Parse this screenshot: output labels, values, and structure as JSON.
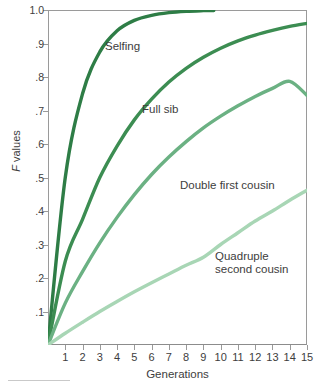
{
  "chart_data": {
    "type": "line",
    "title": "",
    "xlabel": "Generations",
    "ylabel": "F values",
    "ylabel_italic_prefix": "F",
    "ylabel_rest": " values",
    "xlim": [
      0,
      15
    ],
    "ylim": [
      0,
      1.0
    ],
    "grid": false,
    "legend_position": "inline-annotations",
    "x": [
      0,
      1,
      2,
      3,
      4,
      5,
      6,
      7,
      8,
      9,
      10,
      11,
      12,
      13,
      14,
      15
    ],
    "x_tick_labels": [
      "1",
      "2",
      "3",
      "4",
      "5",
      "6",
      "7",
      "8",
      "9",
      "10",
      "11",
      "12",
      "13",
      "14",
      "15"
    ],
    "x_tick_values": [
      1,
      2,
      3,
      4,
      5,
      6,
      7,
      8,
      9,
      10,
      11,
      12,
      13,
      14,
      15
    ],
    "y_tick_labels": [
      "1.0",
      ".9",
      ".8",
      ".7",
      ".6",
      ".5",
      ".4",
      ".3",
      ".2",
      ".1"
    ],
    "y_tick_values": [
      1.0,
      0.9,
      0.8,
      0.7,
      0.6,
      0.5,
      0.4,
      0.3,
      0.2,
      0.1
    ],
    "series": [
      {
        "name": "Selfing",
        "label": "Selfing",
        "color": "#2e7d46",
        "x_end": 9.6,
        "values": [
          0,
          0.5,
          0.75,
          0.875,
          0.938,
          0.969,
          0.984,
          0.992,
          0.996,
          0.998,
          0.999,
          1.0,
          1.0,
          1.0,
          1.0,
          1.0
        ]
      },
      {
        "name": "Full sib",
        "label": "Full sib",
        "color": "#3c8d52",
        "x_end": 15,
        "values": [
          0,
          0.25,
          0.375,
          0.5,
          0.594,
          0.672,
          0.734,
          0.785,
          0.826,
          0.859,
          0.886,
          0.908,
          0.925,
          0.939,
          0.951,
          0.96
        ]
      },
      {
        "name": "Double first cousin",
        "label": "Double first cousin",
        "color": "#6bb183",
        "x_end": 15,
        "values": [
          0,
          0.125,
          0.219,
          0.305,
          0.381,
          0.449,
          0.509,
          0.561,
          0.607,
          0.648,
          0.683,
          0.714,
          0.742,
          0.766,
          0.787,
          0.745
        ]
      },
      {
        "name": "Quadruple second cousin",
        "label": "Quadruple\nsecond cousin",
        "color": "#a8d6b5",
        "x_end": 15,
        "values": [
          0,
          0.035,
          0.068,
          0.1,
          0.13,
          0.159,
          0.186,
          0.212,
          0.238,
          0.262,
          0.3,
          0.335,
          0.37,
          0.4,
          0.432,
          0.462
        ]
      }
    ]
  },
  "axes": {
    "x_title": "Generations",
    "y_title_italic": "F",
    "y_title_rest": " values"
  },
  "annotations": {
    "selfing": "Selfing",
    "full_sib": "Full sib",
    "double_first_cousin": "Double first cousin",
    "quadruple_second_cousin": "Quadruple\nsecond cousin"
  },
  "colors": {
    "selfing": "#2e7d46",
    "full_sib": "#3c8d52",
    "double_first_cousin": "#6bb183",
    "quadruple_second_cousin": "#a8d6b5",
    "axis": "#9a9a9a",
    "text": "#3d3d3d",
    "background": "#ffffff"
  }
}
